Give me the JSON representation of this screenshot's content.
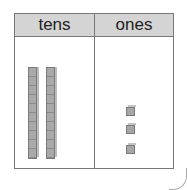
{
  "place_value_chart": {
    "columns": [
      {
        "label": "tens",
        "count": 2,
        "block_type": "ten-rod"
      },
      {
        "label": "ones",
        "count": 3,
        "block_type": "unit-cube"
      }
    ],
    "colors": {
      "header_bg": "#d4d4d4",
      "border": "#777777",
      "block": "#a9a9a9"
    }
  }
}
